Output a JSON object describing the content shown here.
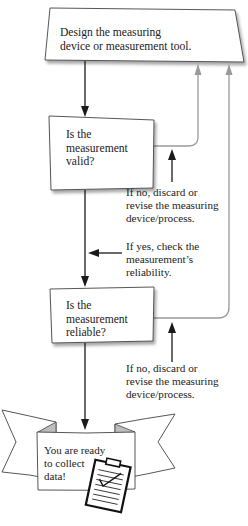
{
  "flowchart": {
    "steps": [
      {
        "id": "design",
        "lines": [
          "Design the measuring",
          "device or measurement tool."
        ]
      },
      {
        "id": "valid",
        "lines": [
          "Is the",
          "measurement",
          "valid?"
        ]
      },
      {
        "id": "reliable",
        "lines": [
          "Is the",
          "measurement",
          "reliable?"
        ]
      },
      {
        "id": "ready",
        "lines": [
          "You are ready",
          "to collect",
          "data!"
        ]
      }
    ],
    "annotations": [
      {
        "id": "no-valid",
        "lines": [
          "If no, discard or",
          "revise the measuring",
          "device/process."
        ]
      },
      {
        "id": "yes-valid",
        "lines": [
          "If yes, check the",
          "measurement’s",
          "reliability."
        ]
      },
      {
        "id": "no-reliable",
        "lines": [
          "If no, discard or",
          "revise the measuring",
          "device/process."
        ]
      }
    ],
    "icons": [
      "clipboard-checklist-icon",
      "banner-ribbon"
    ],
    "colors": {
      "line_black": "#1a1a1a",
      "line_gray": "#9a9a9a",
      "shadow": "#b8b8b8",
      "ribbon_fold": "#bdbdbd"
    }
  }
}
